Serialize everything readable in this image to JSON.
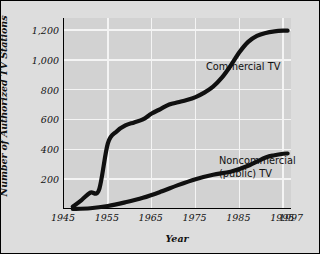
{
  "chart_data": {
    "type": "line",
    "title": "",
    "xlabel": "Year",
    "ylabel": "Number of Authorized TV Stations",
    "xlim": [
      1945,
      1997
    ],
    "ylim": [
      0,
      1280
    ],
    "grid": true,
    "legend_position": "inline-annotations",
    "xticks": [
      {
        "label": "1945",
        "value": 1945
      },
      {
        "label": "1955",
        "value": 1955
      },
      {
        "label": "1965",
        "value": 1965
      },
      {
        "label": "1975",
        "value": 1975
      },
      {
        "label": "1985",
        "value": 1985
      },
      {
        "label": "1995",
        "value": 1995
      },
      {
        "label": "1997",
        "value": 1997
      }
    ],
    "yticks": [
      {
        "label": "200",
        "value": 200
      },
      {
        "label": "400",
        "value": 400
      },
      {
        "label": "600",
        "value": 600
      },
      {
        "label": "800",
        "value": 800
      },
      {
        "label": "1,000",
        "value": 1000
      },
      {
        "label": "1,200",
        "value": 1200
      }
    ],
    "series": [
      {
        "name": "Commercial TV",
        "annotation": "Commercial TV",
        "x": [
          1947,
          1949,
          1951,
          1953,
          1955,
          1957,
          1959,
          1961,
          1963,
          1965,
          1967,
          1969,
          1971,
          1973,
          1975,
          1977,
          1979,
          1981,
          1983,
          1985,
          1987,
          1989,
          1991,
          1993,
          1995,
          1996
        ],
        "values": [
          15,
          60,
          110,
          130,
          440,
          520,
          560,
          580,
          600,
          640,
          670,
          700,
          715,
          730,
          750,
          780,
          820,
          880,
          960,
          1050,
          1120,
          1160,
          1180,
          1190,
          1195,
          1195
        ]
      },
      {
        "name": "Noncommercial (public) TV",
        "annotation": "Noncommercial\n(public) TV",
        "x": [
          1947,
          1951,
          1955,
          1959,
          1963,
          1967,
          1971,
          1975,
          1979,
          1983,
          1987,
          1991,
          1993,
          1995,
          1996
        ],
        "values": [
          0,
          5,
          20,
          45,
          75,
          115,
          160,
          200,
          230,
          250,
          290,
          345,
          360,
          370,
          372
        ]
      }
    ]
  },
  "figure": {
    "background_color": "#dddddd",
    "plot_background_color": "#d2d2d2",
    "gridline_color": "#f4f4f4",
    "line_color": "#101010",
    "axis_color": "#000000"
  }
}
